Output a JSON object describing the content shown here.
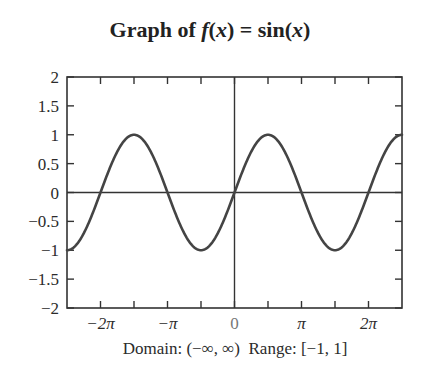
{
  "title": {
    "prefix": "Graph of ",
    "func_name": "f",
    "func_arg_open": "(",
    "func_var": "x",
    "func_arg_close": ")",
    "equals": " = ",
    "rhs_name": "sin",
    "rhs_arg_open": "(",
    "rhs_var": "x",
    "rhs_arg_close": ")"
  },
  "caption": "Domain: (−∞, ∞)  Range: [−1, 1]",
  "colors": {
    "curve": "#444444",
    "axes": "#333333",
    "background": "#ffffff"
  },
  "chart_data": {
    "type": "line",
    "title": "Graph of f(x) = sin(x)",
    "xlabel": "",
    "ylabel": "",
    "caption": "Domain: (−∞, ∞)  Range: [−1, 1]",
    "function": "sin(x)",
    "xlim": [
      -7.854,
      7.854
    ],
    "ylim": [
      -2,
      2
    ],
    "grid": false,
    "legend": null,
    "x_ticks": [
      -6.2832,
      -4.7124,
      -3.1416,
      -1.5708,
      0,
      1.5708,
      3.1416,
      4.7124,
      6.2832
    ],
    "x_tick_labels": [
      {
        "value": -6.2832,
        "label": "−2π"
      },
      {
        "value": -3.1416,
        "label": "−π"
      },
      {
        "value": 0,
        "label": "0"
      },
      {
        "value": 3.1416,
        "label": "π"
      },
      {
        "value": 6.2832,
        "label": "2π"
      }
    ],
    "y_ticks": [
      2,
      1.5,
      1,
      0.5,
      0,
      -0.5,
      -1,
      -1.5,
      -2
    ],
    "y_tick_labels": [
      "2",
      "1.5",
      "1",
      "0.5",
      "0",
      "−0.5",
      "−1",
      "−1.5",
      "−2"
    ],
    "series": [
      {
        "name": "sin(x)",
        "x": [
          -7.854,
          -7.0686,
          -6.2832,
          -5.4978,
          -4.7124,
          -3.927,
          -3.1416,
          -2.3562,
          -1.5708,
          -0.7854,
          0,
          0.7854,
          1.5708,
          2.3562,
          3.1416,
          3.927,
          4.7124,
          5.4978,
          6.2832,
          7.0686,
          7.854
        ],
        "y": [
          -1,
          -0.7071,
          0,
          0.7071,
          1,
          0.7071,
          0,
          -0.7071,
          -1,
          -0.7071,
          0,
          0.7071,
          1,
          0.7071,
          0,
          -0.7071,
          -1,
          -0.7071,
          0,
          0.7071,
          1
        ]
      }
    ],
    "axes_lines": {
      "x_axis_at_y": 0,
      "y_axis_at_x": 0
    }
  }
}
